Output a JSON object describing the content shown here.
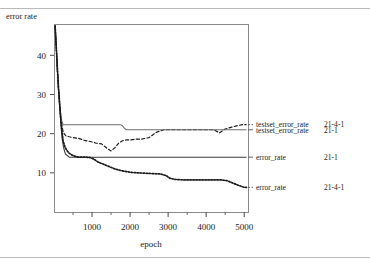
{
  "figure": {
    "name": "error-rate-vs-epoch-plot",
    "background": "#ffffff",
    "ink_color": "#1a1a1a",
    "rule_color": "#b9b9b9"
  },
  "axes": {
    "y_axis_label": "error rate",
    "x_axis_label": "epoch",
    "y_ticks": [
      10,
      20,
      30,
      40
    ],
    "y_tick_labels": [
      "10",
      "20",
      "30",
      "40"
    ],
    "x_ticks": [
      1000,
      2000,
      3000,
      4000,
      5000
    ],
    "x_tick_labels": [
      "1000",
      "2000",
      "3000",
      "4000",
      "5000"
    ],
    "x_minor_ticks": [
      500,
      1500,
      2500,
      3500,
      4500
    ],
    "xlim": [
      0,
      5100
    ],
    "ylim": [
      0,
      48
    ],
    "frame": "box",
    "grid": false
  },
  "legend": {
    "position": "right-outside",
    "entries": [
      {
        "label": "testset_error_rate",
        "model": "21-4-1",
        "style": "dashed",
        "y_value": 22.3
      },
      {
        "label": "testset_error_rate",
        "model": "21-1",
        "style": "solid",
        "y_value": 21.0
      },
      {
        "label": "error_rate",
        "model": "21-1",
        "style": "solid",
        "y_value": 14.0
      },
      {
        "label": "error_rate",
        "model": "21-4-1",
        "style": "dotted",
        "y_value": 6.3
      }
    ]
  },
  "chart_data": {
    "type": "line",
    "title": "",
    "xlabel": "epoch",
    "ylabel": "error rate",
    "xlim": [
      0,
      5100
    ],
    "ylim": [
      0,
      48
    ],
    "grid": false,
    "legend_position": "right-outside",
    "series": [
      {
        "name": "testset_error_rate 21-4-1",
        "model": "21-4-1",
        "style": "dashed",
        "color": "#1a1a1a",
        "x": [
          30,
          60,
          90,
          120,
          150,
          180,
          210,
          240,
          280,
          320,
          400,
          500,
          650,
          800,
          950,
          1100,
          1250,
          1400,
          1500,
          1600,
          1700,
          1800,
          1900,
          2000,
          2150,
          2300,
          2500,
          2700,
          2900,
          3050,
          3200,
          3400,
          3600,
          3800,
          4000,
          4200,
          4350,
          4500,
          4650,
          4800,
          4950,
          5050
        ],
        "y": [
          47.5,
          42.0,
          36.0,
          31.0,
          27.0,
          24.0,
          22.0,
          20.5,
          19.8,
          19.4,
          19.2,
          19.0,
          18.8,
          18.3,
          18.0,
          17.6,
          17.4,
          16.2,
          15.6,
          16.4,
          17.6,
          18.2,
          18.4,
          18.4,
          18.6,
          18.6,
          19.0,
          20.4,
          21.0,
          21.0,
          21.0,
          21.0,
          21.0,
          21.0,
          21.0,
          21.0,
          20.2,
          21.2,
          21.6,
          22.0,
          22.3,
          22.3
        ]
      },
      {
        "name": "testset_error_rate 21-1",
        "model": "21-1",
        "style": "solid",
        "color": "#6d6d6d",
        "x": [
          30,
          60,
          90,
          120,
          150,
          180,
          210,
          240,
          280,
          340,
          420,
          600,
          900,
          1200,
          1500,
          1750,
          1800,
          1850,
          1900,
          2200,
          2600,
          3000,
          3500,
          4000,
          4500,
          5050
        ],
        "y": [
          47.5,
          42.0,
          36.0,
          31.0,
          27.5,
          24.5,
          23.0,
          22.3,
          22.3,
          22.3,
          22.3,
          22.3,
          22.3,
          22.3,
          22.3,
          22.3,
          22.0,
          21.4,
          21.0,
          21.0,
          21.0,
          21.0,
          21.0,
          21.0,
          21.0,
          21.0
        ]
      },
      {
        "name": "error_rate 21-1",
        "model": "21-1",
        "style": "solid",
        "color": "#3a3a3a",
        "x": [
          30,
          60,
          90,
          120,
          150,
          180,
          210,
          250,
          300,
          400,
          600,
          1000,
          1500,
          2000,
          2500,
          3000,
          3500,
          4000,
          4500,
          5050
        ],
        "y": [
          47.5,
          42.0,
          36.0,
          31.0,
          26.5,
          22.5,
          19.0,
          16.5,
          14.8,
          14.0,
          14.0,
          14.0,
          14.0,
          14.0,
          14.0,
          14.0,
          14.0,
          14.0,
          14.0,
          14.0
        ]
      },
      {
        "name": "error_rate 21-4-1",
        "model": "21-4-1",
        "style": "dotted",
        "color": "#1a1a1a",
        "x": [
          30,
          60,
          90,
          120,
          150,
          180,
          210,
          240,
          280,
          330,
          400,
          480,
          560,
          650,
          750,
          850,
          950,
          1050,
          1150,
          1300,
          1450,
          1600,
          1750,
          1900,
          2050,
          2200,
          2400,
          2600,
          2800,
          2950,
          3050,
          3200,
          3400,
          3600,
          3800,
          4000,
          4200,
          4400,
          4550,
          4700,
          4850,
          5000,
          5060
        ],
        "y": [
          47.5,
          42.0,
          36.5,
          31.5,
          27.5,
          23.5,
          20.5,
          18.2,
          16.8,
          15.8,
          15.0,
          14.5,
          14.2,
          14.0,
          14.0,
          14.0,
          13.9,
          13.5,
          12.8,
          12.2,
          11.6,
          11.0,
          10.6,
          10.3,
          10.1,
          10.0,
          9.9,
          9.8,
          9.7,
          9.3,
          8.6,
          8.3,
          8.2,
          8.2,
          8.2,
          8.2,
          8.2,
          8.2,
          8.0,
          7.4,
          6.8,
          6.3,
          6.3
        ]
      }
    ]
  }
}
